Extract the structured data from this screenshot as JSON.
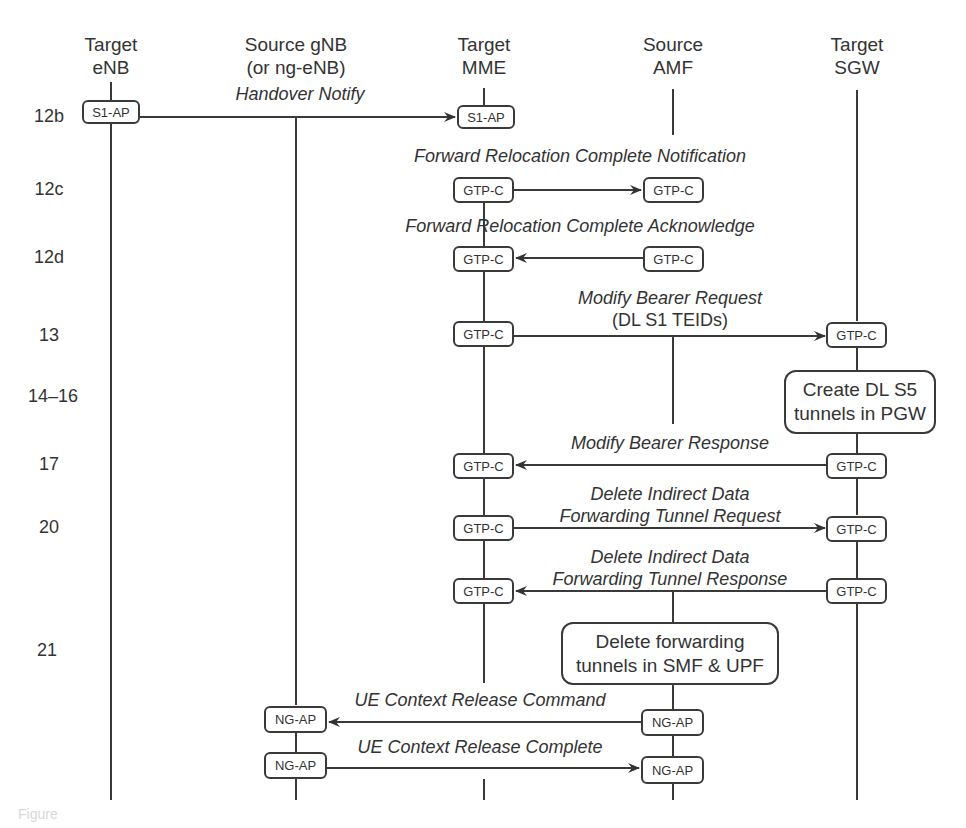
{
  "nodes": [
    {
      "id": "target-enb",
      "line1": "Target",
      "line2": "eNB",
      "x": 111
    },
    {
      "id": "source-gnb",
      "line1": "Source gNB",
      "line2": "(or ng-eNB)",
      "x": 296
    },
    {
      "id": "target-mme",
      "line1": "Target",
      "line2": "MME",
      "x": 484
    },
    {
      "id": "source-amf",
      "line1": "Source",
      "line2": "AMF",
      "x": 673
    },
    {
      "id": "target-sgw",
      "line1": "Target",
      "line2": "SGW",
      "x": 857
    }
  ],
  "steps": [
    {
      "label": "12b",
      "y": 117
    },
    {
      "label": "12c",
      "y": 190
    },
    {
      "label": "12d",
      "y": 258
    },
    {
      "label": "13",
      "y": 336
    },
    {
      "label": "14–16",
      "y": 397
    },
    {
      "label": "17",
      "y": 465
    },
    {
      "label": "20",
      "y": 526
    },
    {
      "label": "21",
      "y": 650
    }
  ],
  "messages": [
    {
      "id": "handover-notify",
      "label": "Handover Notify",
      "label2": "",
      "from": "S1-AP",
      "to": "S1-AP",
      "direction": "right"
    },
    {
      "id": "fwd-reloc-complete-notification",
      "label": "Forward Relocation Complete Notification",
      "label2": "",
      "from": "GTP-C",
      "to": "GTP-C",
      "direction": "right"
    },
    {
      "id": "fwd-reloc-complete-ack",
      "label": "Forward Relocation Complete Acknowledge",
      "label2": "",
      "from": "GTP-C",
      "to": "GTP-C",
      "direction": "left"
    },
    {
      "id": "modify-bearer-request",
      "label": "Modify Bearer Request",
      "label2": "(DL S1 TEIDs)",
      "from": "GTP-C",
      "to": "GTP-C",
      "direction": "right"
    },
    {
      "id": "modify-bearer-response",
      "label": "Modify Bearer Response",
      "label2": "",
      "from": "GTP-C",
      "to": "GTP-C",
      "direction": "left"
    },
    {
      "id": "delete-indirect-request",
      "label": "Delete Indirect Data",
      "label2": "Forwarding Tunnel Request",
      "from": "GTP-C",
      "to": "GTP-C",
      "direction": "right"
    },
    {
      "id": "delete-indirect-response",
      "label": "Delete Indirect Data",
      "label2": "Forwarding Tunnel Response",
      "from": "GTP-C",
      "to": "GTP-C",
      "direction": "left"
    },
    {
      "id": "ue-context-release-command",
      "label": "UE Context Release Command",
      "label2": "",
      "from": "NG-AP",
      "to": "NG-AP",
      "direction": "left"
    },
    {
      "id": "ue-context-release-complete",
      "label": "UE Context Release Complete",
      "label2": "",
      "from": "NG-AP",
      "to": "NG-AP",
      "direction": "right"
    }
  ],
  "protocols": {
    "s1ap": "S1-AP",
    "gtpc": "GTP-C",
    "ngap": "NG-AP"
  },
  "actions": [
    {
      "id": "create-dl-s5",
      "line1": "Create DL S5",
      "line2": "tunnels in PGW"
    },
    {
      "id": "delete-forwarding",
      "line1": "Delete forwarding",
      "line2": "tunnels in SMF & UPF"
    }
  ],
  "caption": "Figure"
}
